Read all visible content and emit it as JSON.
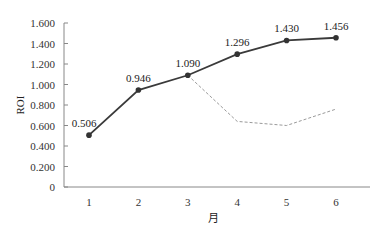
{
  "chart_data": {
    "type": "line",
    "title": "",
    "xlabel": "月",
    "ylabel": "ROI",
    "categories": [
      "1",
      "2",
      "3",
      "4",
      "5",
      "6"
    ],
    "ylim": [
      0,
      1.6
    ],
    "yticks": [
      "0",
      "0.200",
      "0.400",
      "0.600",
      "0.800",
      "1.000",
      "1.200",
      "1.400",
      "1.600"
    ],
    "grid": false,
    "legend": null,
    "series": [
      {
        "name": "ROI (actual)",
        "style": "solid-with-markers",
        "color": "#3a3a3a",
        "values": [
          0.506,
          0.946,
          1.09,
          1.296,
          1.43,
          1.456
        ],
        "labels": [
          "0.506",
          "0.946",
          "1.090",
          "1.296",
          "1.430",
          "1.456"
        ]
      },
      {
        "name": "ROI (baseline projection)",
        "style": "dashed",
        "color": "#9a9a9a",
        "x": [
          "3",
          "4",
          "5",
          "6"
        ],
        "values": [
          1.09,
          0.64,
          0.6,
          0.76
        ]
      }
    ]
  }
}
